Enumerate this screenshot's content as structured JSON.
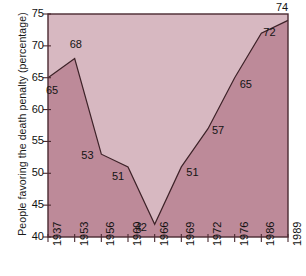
{
  "chart_data": {
    "type": "area",
    "title": "",
    "xlabel": "",
    "ylabel": "People favoring the death penalty (percentage)",
    "categories": [
      "1937",
      "1953",
      "1956",
      "1960",
      "1966",
      "1969",
      "1972",
      "1976",
      "1986",
      "1989"
    ],
    "values": [
      65,
      68,
      53,
      51,
      42,
      51,
      57,
      65,
      72,
      74
    ],
    "point_labels": [
      "65",
      "68",
      "53",
      "51",
      "42",
      "51",
      "57",
      "65",
      "72",
      "74"
    ],
    "ylim": [
      40,
      75
    ],
    "yticks": [
      "40",
      "45",
      "50",
      "55",
      "60",
      "65",
      "70",
      "75"
    ],
    "ytick_values": [
      40,
      45,
      50,
      55,
      60,
      65,
      70,
      75
    ],
    "grid": false,
    "legend": "none",
    "colors": {
      "plot_background": "#d7b8c1",
      "area_fill": "#bd8a99",
      "line": "#3d2228",
      "frame": "#4a2a31",
      "text": "#141414",
      "page_background": "#ffffff"
    }
  },
  "axes": {
    "y_title": "People favoring the death penalty (percentage)"
  },
  "point_label_offsets": [
    {
      "dx": -2,
      "dy": 13
    },
    {
      "dx": -5,
      "dy": -14
    },
    {
      "dx": -20,
      "dy": 2
    },
    {
      "dx": -16,
      "dy": 10
    },
    {
      "dx": -20,
      "dy": 4
    },
    {
      "dx": 5,
      "dy": 6
    },
    {
      "dx": 4,
      "dy": 2
    },
    {
      "dx": 5,
      "dy": 7
    },
    {
      "dx": 2,
      "dy": 0
    },
    {
      "dx": -12,
      "dy": -12
    }
  ]
}
